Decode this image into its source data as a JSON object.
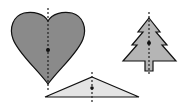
{
  "diagram": {
    "colors": {
      "background": "#ffffff",
      "heart_fill": "#8a8a8a",
      "tree_fill": "#b5b5b5",
      "triangle_fill": "#e4e4e4",
      "stroke": "#111111",
      "axis": "#222222"
    },
    "shapes": [
      {
        "name": "heart",
        "axis_x": 48,
        "center": [
          48,
          50
        ]
      },
      {
        "name": "tree",
        "axis_x": 149,
        "center": [
          149,
          43
        ]
      },
      {
        "name": "triangle",
        "axis_x": 92,
        "center": [
          92,
          88
        ]
      }
    ]
  }
}
